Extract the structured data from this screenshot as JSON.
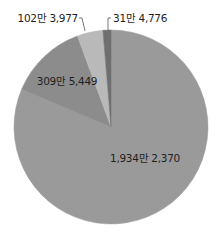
{
  "chart_data": {
    "type": "pie",
    "title": "",
    "start_angle_deg": 0,
    "direction": "clockwise",
    "total": 23776572,
    "series": [
      {
        "name": "slice-1",
        "value": 19342370,
        "label": "1,934만 2,370",
        "color": "#9a9a9a",
        "label_pos": [
          145,
          162
        ],
        "label_anchor": "middle"
      },
      {
        "name": "slice-2",
        "value": 3095449,
        "label": "309만 5,449",
        "color": "#8c8c8c",
        "label_pos": [
          67,
          85
        ],
        "label_anchor": "middle"
      },
      {
        "name": "slice-3",
        "value": 1023977,
        "label": "102만 3,977",
        "color": "#b9b9b9",
        "label_pos": [
          78,
          22
        ],
        "label_anchor": "end",
        "leader": [
          [
            79,
            18
          ],
          [
            82,
            18
          ],
          [
            85,
            31
          ]
        ]
      },
      {
        "name": "slice-4",
        "value": 314776,
        "label": "31만 4,776",
        "color": "#6f6f6f",
        "label_pos": [
          113,
          22
        ],
        "label_anchor": "start",
        "leader": [
          [
            111,
            18
          ],
          [
            108,
            18
          ],
          [
            108,
            30
          ]
        ]
      }
    ],
    "center": [
      111,
      127
    ],
    "radius": 97,
    "legend": null,
    "grid": false
  }
}
